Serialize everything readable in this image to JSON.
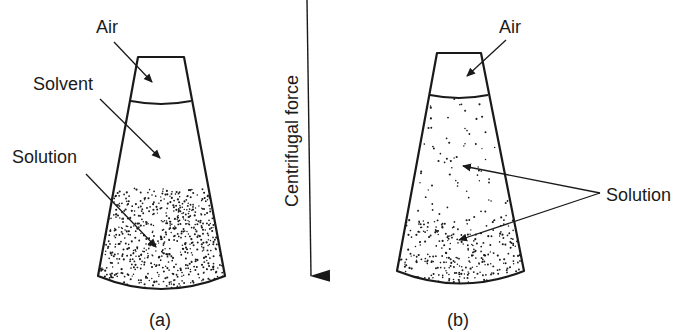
{
  "figure": {
    "panel_a": {
      "caption": "(a)",
      "labels": {
        "air": "Air",
        "solvent": "Solvent",
        "solution": "Solution"
      }
    },
    "force_arrow": {
      "label": "Centrifugal force",
      "direction": "down"
    },
    "panel_b": {
      "caption": "(b)",
      "labels": {
        "air": "Air",
        "solution": "Solution"
      }
    },
    "colors": {
      "ink": "#1a1a1a",
      "background": "#ffffff"
    }
  }
}
